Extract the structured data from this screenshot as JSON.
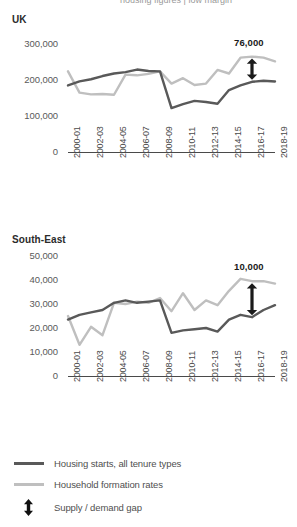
{
  "page": {
    "cut_off_header": "housing figures | low margin",
    "background": "#ffffff"
  },
  "colors": {
    "housing_starts": "#595959",
    "household_formation": "#bfbfbf",
    "axis": "#4a4a4a",
    "text": "#4f4f4f",
    "annotation": "#1a1a1a"
  },
  "legend": {
    "items": [
      {
        "label": "Housing starts, all tenure types",
        "icon": "line-swatch-dark",
        "color": "#595959"
      },
      {
        "label": "Household formation rates",
        "icon": "line-swatch-light",
        "color": "#bfbfbf"
      },
      {
        "label": "Supply / demand gap",
        "icon": "double-arrow-icon",
        "color": "#111111"
      }
    ]
  },
  "chart_data": [
    {
      "type": "line",
      "title": "UK",
      "xlabel": "",
      "ylabel": "",
      "ylim": [
        0,
        300000
      ],
      "yticks": [
        0,
        100000,
        200000,
        300000
      ],
      "ytick_labels": [
        "0",
        "100,000",
        "200,000",
        "300,000"
      ],
      "grid": false,
      "legend_position": "bottom",
      "x": [
        "2000-01",
        "2001-02",
        "2002-03",
        "2003-04",
        "2004-05",
        "2005-06",
        "2006-07",
        "2007-08",
        "2008-09",
        "2009-10",
        "2010-11",
        "2011-12",
        "2012-13",
        "2013-14",
        "2014-15",
        "2015-16",
        "2016-17",
        "2017-18",
        "2018-19"
      ],
      "xtick_labels": [
        "2000-01",
        "2002-03",
        "2004-05",
        "2006-07",
        "2008-09",
        "2010-11",
        "2012-13",
        "2014-15",
        "2016-17",
        "2018-19"
      ],
      "annotation": {
        "text": "76,000",
        "kind": "supply-demand-gap"
      },
      "series": [
        {
          "name": "Housing starts, all tenure types",
          "color": "#595959",
          "values": [
            185000,
            196000,
            202000,
            211000,
            218000,
            222000,
            229000,
            225000,
            224000,
            122000,
            133000,
            142000,
            139000,
            134000,
            172000,
            185000,
            195000,
            198000,
            196000
          ]
        },
        {
          "name": "Household formation rates",
          "color": "#bfbfbf",
          "values": [
            224000,
            165000,
            160000,
            161000,
            159000,
            215000,
            213000,
            217000,
            224000,
            190000,
            205000,
            186000,
            190000,
            228000,
            218000,
            262000,
            265000,
            262000,
            252000
          ]
        }
      ]
    },
    {
      "type": "line",
      "title": "South-East",
      "xlabel": "",
      "ylabel": "",
      "ylim": [
        0,
        50000
      ],
      "yticks": [
        0,
        10000,
        20000,
        30000,
        40000,
        50000
      ],
      "ytick_labels": [
        "0",
        "10,000",
        "20,000",
        "30,000",
        "40,000",
        "50,000"
      ],
      "grid": false,
      "legend_position": "bottom",
      "x": [
        "2000-01",
        "2001-02",
        "2002-03",
        "2003-04",
        "2004-05",
        "2005-06",
        "2006-07",
        "2007-08",
        "2008-09",
        "2009-10",
        "2010-11",
        "2011-12",
        "2012-13",
        "2013-14",
        "2014-15",
        "2015-16",
        "2016-17",
        "2017-18",
        "2018-19"
      ],
      "xtick_labels": [
        "2000-01",
        "2002-03",
        "2004-05",
        "2006-07",
        "2008-09",
        "2010-11",
        "2012-13",
        "2014-15",
        "2016-17",
        "2018-19"
      ],
      "annotation": {
        "text": "10,000",
        "kind": "supply-demand-gap"
      },
      "series": [
        {
          "name": "Housing starts, all tenure types",
          "color": "#595959",
          "values": [
            23500,
            25500,
            26500,
            27500,
            30500,
            31500,
            30500,
            31000,
            31500,
            18000,
            19000,
            19500,
            20000,
            18500,
            23500,
            25500,
            24500,
            27500,
            29500
          ]
        },
        {
          "name": "Household formation rates",
          "color": "#bfbfbf",
          "values": [
            25000,
            13000,
            20500,
            17000,
            30500,
            30000,
            31000,
            30500,
            32500,
            27000,
            34500,
            27500,
            31500,
            29500,
            35500,
            40500,
            39500,
            39500,
            38500
          ]
        }
      ]
    }
  ]
}
